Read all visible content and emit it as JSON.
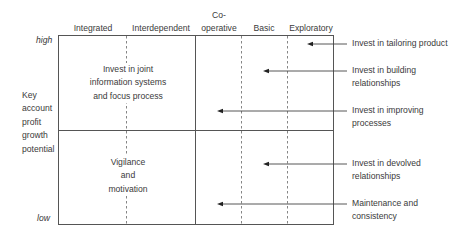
{
  "diagram": {
    "columns": [
      {
        "label": "Integrated"
      },
      {
        "label": "Interdependent"
      },
      {
        "label_line1": "Co-",
        "label_line2": "operative"
      },
      {
        "label": "Basic"
      },
      {
        "label": "Exploratory"
      }
    ],
    "y_axis": {
      "high": "high",
      "low": "low",
      "title_lines": [
        "Key",
        "account",
        "profit",
        "growth",
        "potential"
      ]
    },
    "quadrants": {
      "top_left_lines": [
        "Invest in joint",
        "information systems",
        "and focus process"
      ],
      "bottom_left_lines": [
        "Vigilance",
        "and",
        "motivation"
      ]
    },
    "annotations": [
      {
        "lines": [
          "Invest in tailoring product"
        ]
      },
      {
        "lines": [
          "Invest in building",
          "relationships"
        ]
      },
      {
        "lines": [
          "Invest in improving",
          "processes"
        ]
      },
      {
        "lines": [
          "Invest in devolved",
          "relationships"
        ]
      },
      {
        "lines": [
          "Maintenance and",
          "consistency"
        ]
      }
    ],
    "colors": {
      "line": "#555555",
      "text": "#3a3a3a"
    }
  }
}
